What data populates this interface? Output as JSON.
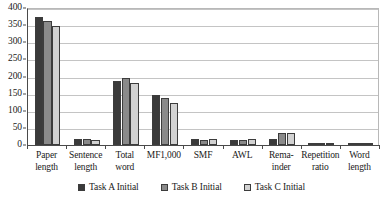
{
  "chart_data": {
    "type": "bar",
    "title": "",
    "subtitle": "",
    "xlabel": "",
    "ylabel": "",
    "ylim": [
      0,
      400
    ],
    "ytick_step": 50,
    "yticks": [
      0,
      50,
      100,
      150,
      200,
      250,
      300,
      350,
      400
    ],
    "grid": true,
    "legend_position": "bottom-center",
    "categories": [
      "Paper length",
      "Sentence length",
      "Total word",
      "MF1,000",
      "SMF",
      "AWL",
      "Remainder",
      "Repetition ratio",
      "Word length"
    ],
    "category_lines": [
      [
        "Paper",
        "length"
      ],
      [
        "Sentence",
        "length"
      ],
      [
        "Total",
        "word"
      ],
      [
        "MF1,000"
      ],
      [
        "SMF"
      ],
      [
        "AWL"
      ],
      [
        "Rema-",
        "inder"
      ],
      [
        "Repetition",
        "ratio"
      ],
      [
        "Word",
        "length"
      ]
    ],
    "series": [
      {
        "name": "Task A Initial",
        "color": "#3a3a3a",
        "values": [
          375,
          18,
          188,
          147,
          18,
          15,
          19,
          2,
          6
        ]
      },
      {
        "name": "Task B Initial",
        "color": "#8a8a8a",
        "values": [
          362,
          18,
          196,
          136,
          16,
          15,
          36,
          2,
          6
        ]
      },
      {
        "name": "Task C Initial",
        "color": "#d2d2d2",
        "values": [
          348,
          16,
          182,
          124,
          18,
          17,
          36,
          2,
          6
        ]
      }
    ]
  },
  "legend": {
    "items": [
      {
        "label": "Task A Initial",
        "swatch": "#3a3a3a"
      },
      {
        "label": "Task B Initial",
        "swatch": "#8a8a8a"
      },
      {
        "label": "Task C Initial",
        "swatch": "#d2d2d2"
      }
    ]
  }
}
